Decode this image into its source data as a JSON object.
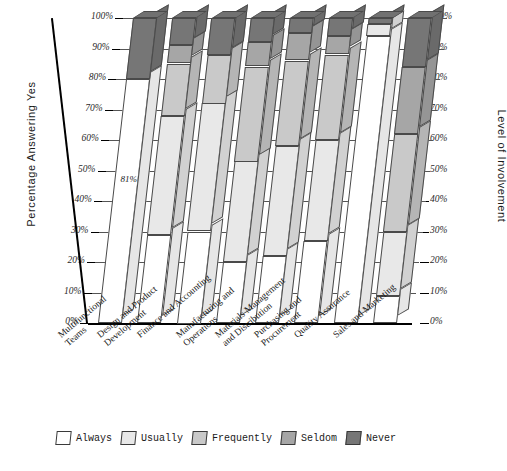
{
  "chart_data": {
    "type": "bar",
    "subtype": "stacked-3d-percent",
    "title": "",
    "xlabel": "",
    "ylabel": "Percentage Answering Yes",
    "y2label": "Level of Involvement",
    "ylim": [
      0,
      100
    ],
    "yticks": [
      "0%",
      "10%",
      "20%",
      "30%",
      "40%",
      "50%",
      "60%",
      "70%",
      "80%",
      "90%",
      "100%"
    ],
    "y2ticks": [
      "0%",
      "10%",
      "20%",
      "30%",
      "40%",
      "50%",
      "60%",
      "70%",
      "80%",
      "90%",
      "100%"
    ],
    "grid": true,
    "legend_position": "bottom",
    "categories": [
      "Multifunctional Teams",
      "Design and Product Development",
      "Finance and Accounting",
      "Manufacturing and Operations",
      "Materials Management and Distribution",
      "Purchasing and Procurement",
      "Quality Assurance",
      "Sales and Marketing"
    ],
    "series": [
      {
        "name": "Always",
        "color": "#ffffff",
        "values": [
          80,
          29,
          30,
          20,
          22,
          27,
          94,
          9
        ]
      },
      {
        "name": "Usually",
        "color": "#e8e8e8",
        "values": [
          0,
          39,
          42,
          33,
          36,
          33,
          4,
          21
        ]
      },
      {
        "name": "Frequently",
        "color": "#c9c9c9",
        "values": [
          0,
          17,
          16,
          31,
          28,
          28,
          0,
          32
        ]
      },
      {
        "name": "Seldom",
        "color": "#a6a6a6",
        "values": [
          0,
          6,
          0,
          8,
          9,
          6,
          0,
          22
        ]
      },
      {
        "name": "Never",
        "color": "#767676",
        "values": [
          20,
          9,
          12,
          8,
          5,
          6,
          2,
          16
        ]
      }
    ],
    "annotations": [
      {
        "text": "81%",
        "category": "Multifunctional Teams",
        "value": 47
      }
    ]
  },
  "legend": {
    "items": [
      {
        "label": "Always"
      },
      {
        "label": "Usually"
      },
      {
        "label": "Frequently"
      },
      {
        "label": "Seldom"
      },
      {
        "label": "Never"
      }
    ]
  },
  "axes": {
    "left_title": "Percentage Answering Yes",
    "right_title": "Level of Involvement"
  },
  "category_lines": [
    [
      "Multifunctional",
      "Teams"
    ],
    [
      "Design and Product",
      "Development"
    ],
    [
      "Finance and Accounting"
    ],
    [
      "Manufacturing and",
      "Operations"
    ],
    [
      "Materials Management",
      "and Distribution"
    ],
    [
      "Purchasing and",
      "Procurement"
    ],
    [
      "Quality Assurance"
    ],
    [
      "Sales and Marketing"
    ]
  ]
}
